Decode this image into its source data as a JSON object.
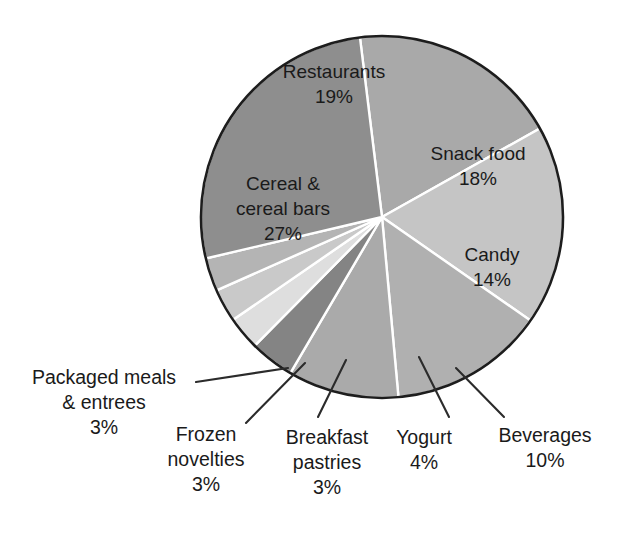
{
  "chart_data": {
    "type": "pie",
    "title": "",
    "subtitle": "",
    "xlabel": "",
    "ylabel": "",
    "legend_position": "none",
    "grid": false,
    "units": "percent",
    "start_angle_deg": -97,
    "direction": "clockwise",
    "categories": [
      "Restaurants",
      "Snack food",
      "Candy",
      "Beverages",
      "Yogurt",
      "Breakfast pastries",
      "Frozen novelties",
      "Packaged meals & entrees",
      "Cereal & cereal bars"
    ],
    "values": [
      19,
      18,
      14,
      10,
      4,
      3,
      3,
      3,
      27
    ],
    "labels": [
      "19%",
      "18%",
      "14%",
      "10%",
      "4%",
      "3%",
      "3%",
      "3%",
      "27%"
    ],
    "colors": [
      "#a9a9a9",
      "#c5c5c5",
      "#b0b0b0",
      "#aaaaaa",
      "#848484",
      "#dedede",
      "#c9c9c9",
      "#b4b4b4",
      "#8e8e8e"
    ],
    "slices": [
      {
        "name": "Restaurants",
        "value": 19,
        "percent_label": "19%",
        "color": "#a9a9a9",
        "label_placement": "inside",
        "label_lines": [
          "Restaurants",
          "19%"
        ],
        "label_x": 334,
        "label_y": 78
      },
      {
        "name": "Snack food",
        "value": 18,
        "percent_label": "18%",
        "color": "#c5c5c5",
        "label_placement": "inside",
        "label_lines": [
          "Snack food",
          "18%"
        ],
        "label_x": 478,
        "label_y": 160
      },
      {
        "name": "Candy",
        "value": 14,
        "percent_label": "14%",
        "color": "#b0b0b0",
        "label_placement": "inside",
        "label_lines": [
          "Candy",
          "14%"
        ],
        "label_x": 492,
        "label_y": 261
      },
      {
        "name": "Beverages",
        "value": 10,
        "percent_label": "10%",
        "color": "#aaaaaa",
        "label_placement": "outside",
        "label_lines": [
          "Beverages",
          "10%"
        ],
        "label_x": 545,
        "label_y": 442,
        "leader": {
          "x1": 456,
          "y1": 368,
          "x2": 504,
          "y2": 417
        }
      },
      {
        "name": "Yogurt",
        "value": 4,
        "percent_label": "4%",
        "color": "#848484",
        "label_placement": "outside",
        "label_lines": [
          "Yogurt",
          "4%"
        ],
        "label_x": 424,
        "label_y": 444,
        "leader": {
          "x1": 419,
          "y1": 357,
          "x2": 449,
          "y2": 417
        }
      },
      {
        "name": "Breakfast pastries",
        "value": 3,
        "percent_label": "3%",
        "color": "#dedede",
        "label_placement": "outside",
        "label_lines": [
          "Breakfast",
          "pastries",
          "3%"
        ],
        "label_x": 327,
        "label_y": 444,
        "leader": {
          "x1": 346,
          "y1": 360,
          "x2": 318,
          "y2": 417
        }
      },
      {
        "name": "Frozen novelties",
        "value": 3,
        "percent_label": "3%",
        "color": "#c9c9c9",
        "label_placement": "outside",
        "label_lines": [
          "Frozen",
          "novelties",
          "3%"
        ],
        "label_x": 206,
        "label_y": 441,
        "leader": {
          "x1": 305,
          "y1": 363,
          "x2": 246,
          "y2": 423
        }
      },
      {
        "name": "Packaged meals & entrees",
        "value": 3,
        "percent_label": "3%",
        "color": "#b4b4b4",
        "label_placement": "outside",
        "label_lines": [
          "Packaged meals",
          "& entrees",
          "3%"
        ],
        "label_x": 104,
        "label_y": 384,
        "leader": {
          "x1": 288,
          "y1": 368,
          "x2": 196,
          "y2": 382
        }
      },
      {
        "name": "Cereal & cereal bars",
        "value": 27,
        "percent_label": "27%",
        "color": "#8e8e8e",
        "label_placement": "inside",
        "label_lines": [
          "Cereal &",
          "cereal bars",
          "27%"
        ],
        "label_x": 283,
        "label_y": 190
      }
    ]
  },
  "geometry": {
    "center_x": 382,
    "center_y": 217,
    "radius": 181
  }
}
